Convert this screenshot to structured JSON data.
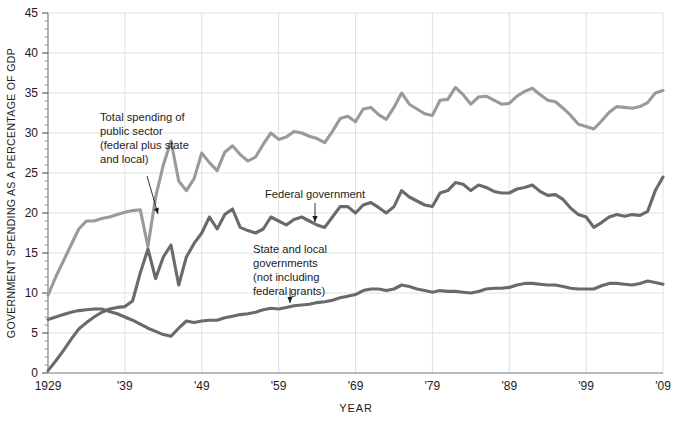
{
  "chart_data": {
    "type": "line",
    "title": "",
    "xlabel": "YEAR",
    "ylabel": "GOVERNMENT SPENDING AS A PERCENTAGE OF GDP",
    "xlim": [
      1929,
      2009
    ],
    "ylim": [
      0,
      45
    ],
    "ytick_step": 5,
    "yticks": [
      0,
      5,
      10,
      15,
      20,
      25,
      30,
      35,
      40,
      45
    ],
    "ytick_labels": [
      "0",
      "5",
      "10",
      "15",
      "20",
      "25",
      "30",
      "35",
      "40",
      "45"
    ],
    "xticks": [
      1929,
      1939,
      1949,
      1959,
      1969,
      1979,
      1989,
      1999,
      2009
    ],
    "xtick_labels": [
      "1929",
      "'39",
      "'49",
      "'59",
      "'69",
      "'79",
      "'89",
      "'99",
      "'09"
    ],
    "grid": true,
    "grid_color": "#d9d9d9",
    "legend_position": "inline-annotations",
    "minor_y_ticks": true,
    "x": [
      1929,
      1930,
      1931,
      1932,
      1933,
      1934,
      1935,
      1936,
      1937,
      1938,
      1939,
      1940,
      1941,
      1942,
      1943,
      1944,
      1945,
      1946,
      1947,
      1948,
      1949,
      1950,
      1951,
      1952,
      1953,
      1954,
      1955,
      1956,
      1957,
      1958,
      1959,
      1960,
      1961,
      1962,
      1963,
      1964,
      1965,
      1966,
      1967,
      1968,
      1969,
      1970,
      1971,
      1972,
      1973,
      1974,
      1975,
      1976,
      1977,
      1978,
      1979,
      1980,
      1981,
      1982,
      1983,
      1984,
      1985,
      1986,
      1987,
      1988,
      1989,
      1990,
      1991,
      1992,
      1993,
      1994,
      1995,
      1996,
      1997,
      1998,
      1999,
      2000,
      2001,
      2002,
      2003,
      2004,
      2005,
      2006,
      2007,
      2008,
      2009
    ],
    "series": [
      {
        "name": "Total spending of public sector (federal plus state and local)",
        "color": "#9a9a9a",
        "values": [
          9.7,
          12.0,
          14.0,
          16.0,
          18.0,
          19.0,
          19.0,
          19.3,
          19.5,
          19.8,
          20.1,
          20.3,
          20.4,
          15.8,
          22.0,
          26.0,
          29.0,
          24.0,
          22.8,
          24.3,
          27.5,
          26.3,
          25.3,
          27.6,
          28.4,
          27.3,
          26.5,
          27.0,
          28.6,
          30.0,
          29.2,
          29.5,
          30.2,
          30.0,
          29.6,
          29.3,
          28.8,
          30.2,
          31.8,
          32.1,
          31.4,
          33.0,
          33.2,
          32.3,
          31.7,
          33.2,
          35.0,
          33.6,
          33.0,
          32.4,
          32.2,
          34.1,
          34.2,
          35.7,
          34.8,
          33.6,
          34.5,
          34.6,
          34.1,
          33.6,
          33.7,
          34.6,
          35.2,
          35.6,
          34.8,
          34.1,
          33.9,
          33.1,
          32.2,
          31.1,
          30.8,
          30.5,
          31.5,
          32.6,
          33.3,
          33.2,
          33.1,
          33.3,
          33.8,
          35.0,
          35.3
        ]
      },
      {
        "name": "Federal government",
        "color": "#6a6a6a",
        "values": [
          0.3,
          1.5,
          2.8,
          4.2,
          5.5,
          6.3,
          7.0,
          7.6,
          8.0,
          8.2,
          8.3,
          9.0,
          12.5,
          15.5,
          11.8,
          14.5,
          16.0,
          11.0,
          14.5,
          16.2,
          17.5,
          19.5,
          18.0,
          19.8,
          20.5,
          18.2,
          17.8,
          17.5,
          18.0,
          19.5,
          19.0,
          18.5,
          19.2,
          19.5,
          19.0,
          18.5,
          18.2,
          19.5,
          20.8,
          20.8,
          20.0,
          21.0,
          21.3,
          20.7,
          20.0,
          20.8,
          22.8,
          22.0,
          21.5,
          21.0,
          20.8,
          22.5,
          22.8,
          23.8,
          23.6,
          22.8,
          23.5,
          23.2,
          22.7,
          22.5,
          22.5,
          23.0,
          23.2,
          23.5,
          22.7,
          22.2,
          22.3,
          21.7,
          20.6,
          19.8,
          19.5,
          18.2,
          18.8,
          19.5,
          19.8,
          19.6,
          19.8,
          19.7,
          20.2,
          22.8,
          24.5
        ]
      },
      {
        "name": "State and local governments (not including federal grants)",
        "color": "#6a6a6a",
        "values": [
          6.7,
          7.0,
          7.3,
          7.6,
          7.8,
          7.9,
          8.0,
          8.0,
          7.7,
          7.4,
          7.0,
          6.6,
          6.1,
          5.6,
          5.2,
          4.8,
          4.6,
          5.6,
          6.5,
          6.3,
          6.5,
          6.6,
          6.6,
          6.9,
          7.1,
          7.3,
          7.4,
          7.6,
          7.9,
          8.1,
          8.0,
          8.2,
          8.4,
          8.5,
          8.6,
          8.8,
          8.9,
          9.1,
          9.4,
          9.6,
          9.8,
          10.3,
          10.5,
          10.5,
          10.3,
          10.5,
          11.0,
          10.8,
          10.5,
          10.3,
          10.1,
          10.3,
          10.2,
          10.2,
          10.1,
          10.0,
          10.2,
          10.5,
          10.6,
          10.6,
          10.7,
          11.0,
          11.2,
          11.2,
          11.1,
          11.0,
          11.0,
          10.8,
          10.6,
          10.5,
          10.5,
          10.5,
          10.9,
          11.2,
          11.2,
          11.1,
          11.0,
          11.2,
          11.5,
          11.3,
          11.1
        ]
      }
    ],
    "annotations": [
      {
        "id": "annot-total",
        "lines": [
          "Total spending of",
          "public sector",
          "(federal plus state",
          "and local)"
        ],
        "text_x": 100,
        "text_y": 121,
        "arrow": {
          "x1": 147,
          "y1": 176,
          "x2": 158,
          "y2": 214
        }
      },
      {
        "id": "annot-federal",
        "lines": [
          "Federal government"
        ],
        "text_x": 265,
        "text_y": 198,
        "arrow": {
          "x1": 315,
          "y1": 203,
          "x2": 315,
          "y2": 222
        }
      },
      {
        "id": "annot-state-local",
        "lines": [
          "State and local",
          "governments",
          "(not including",
          "federal grants)"
        ],
        "text_x": 253,
        "text_y": 253,
        "arrow": {
          "x1": 290,
          "y1": 288,
          "x2": 290,
          "y2": 303
        }
      }
    ]
  }
}
